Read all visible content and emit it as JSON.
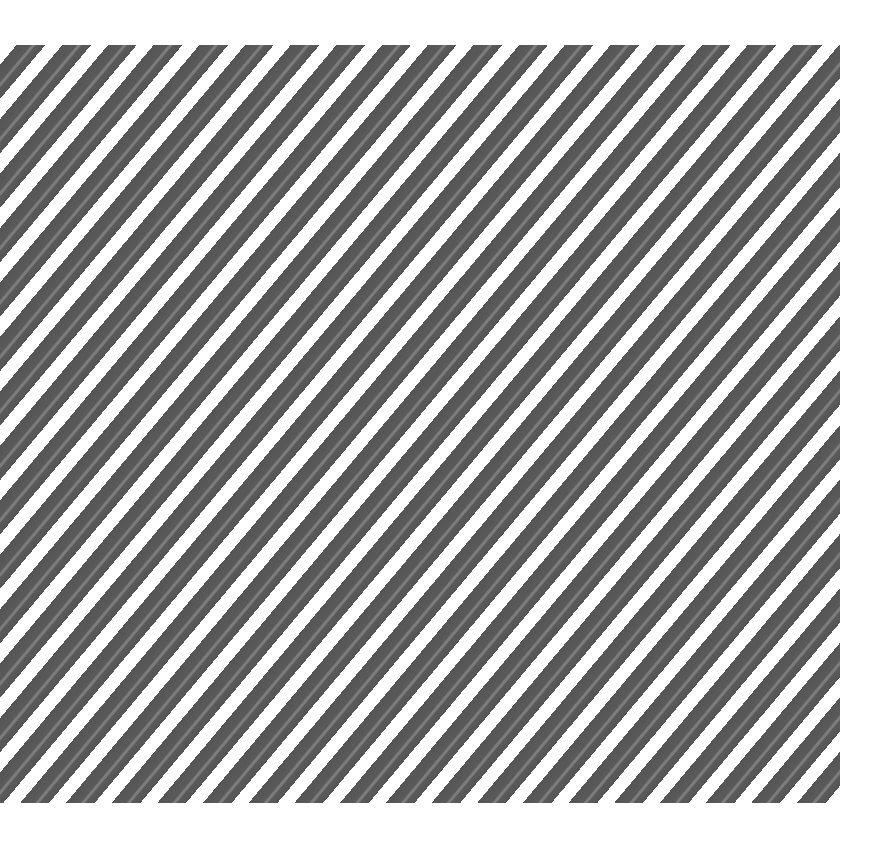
{
  "image": {
    "description": "Diagonal stripe pattern",
    "stripe_color": "#5a5a5a",
    "stripe_highlight_color": "#7c7c7c",
    "background_color": "#ffffff"
  }
}
